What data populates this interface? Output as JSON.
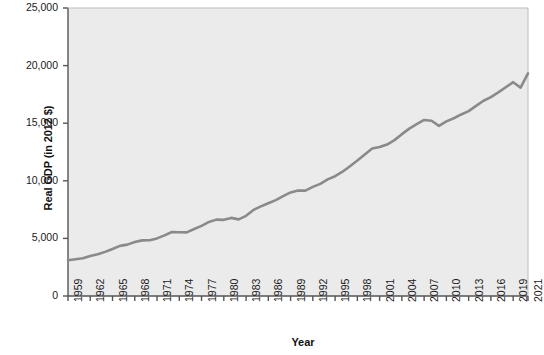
{
  "chart_data": {
    "type": "line",
    "title": "",
    "xlabel": "Year",
    "ylabel": "Real GDP (in 2012 $)",
    "xlim": [
      1959,
      2021
    ],
    "ylim": [
      0,
      25000
    ],
    "grid": false,
    "legend": "none",
    "line_color": "#8a8a8a",
    "plot_background": "#ebebeb",
    "axis_color": "#555555",
    "ytick_labels": [
      "25,000",
      "20,000",
      "15,000",
      "10,000",
      "5,000",
      "0"
    ],
    "ytick_values": [
      25000,
      20000,
      15000,
      10000,
      5000,
      0
    ],
    "xtick_labels": [
      "1959",
      "1962",
      "1965",
      "1968",
      "1971",
      "1974",
      "1977",
      "1980",
      "1983",
      "1986",
      "1989",
      "1992",
      "1995",
      "1998",
      "2001",
      "2004",
      "2007",
      "2010",
      "2013",
      "2016",
      "2019",
      "2021"
    ],
    "xtick_values": [
      1959,
      1962,
      1965,
      1968,
      1971,
      1974,
      1977,
      1980,
      1983,
      1986,
      1989,
      1992,
      1995,
      1998,
      2001,
      2004,
      2007,
      2010,
      2013,
      2016,
      2019,
      2021
    ],
    "series": [
      {
        "name": "Real GDP",
        "x": [
          1959,
          1960,
          1961,
          1962,
          1963,
          1964,
          1965,
          1966,
          1967,
          1968,
          1969,
          1970,
          1971,
          1972,
          1973,
          1974,
          1975,
          1976,
          1977,
          1978,
          1979,
          1980,
          1981,
          1982,
          1983,
          1984,
          1985,
          1986,
          1987,
          1988,
          1989,
          1990,
          1991,
          1992,
          1993,
          1994,
          1995,
          1996,
          1997,
          1998,
          1999,
          2000,
          2001,
          2002,
          2003,
          2004,
          2005,
          2006,
          2007,
          2008,
          2009,
          2010,
          2011,
          2012,
          2013,
          2014,
          2015,
          2016,
          2017,
          2018,
          2019,
          2020,
          2021
        ],
        "values": [
          3100,
          3190,
          3270,
          3470,
          3620,
          3830,
          4080,
          4350,
          4460,
          4680,
          4830,
          4840,
          5000,
          5260,
          5560,
          5530,
          5520,
          5820,
          6090,
          6430,
          6630,
          6610,
          6780,
          6650,
          6960,
          7470,
          7780,
          8050,
          8320,
          8670,
          8990,
          9160,
          9150,
          9470,
          9730,
          10120,
          10400,
          10790,
          11270,
          11760,
          12290,
          12800,
          12930,
          13150,
          13530,
          14050,
          14530,
          14920,
          15280,
          15210,
          14770,
          15160,
          15430,
          15760,
          16050,
          16500,
          16950,
          17270,
          17670,
          18120,
          18560,
          18090,
          19330
        ]
      }
    ]
  }
}
